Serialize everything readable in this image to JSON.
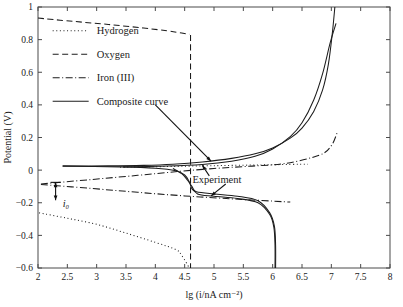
{
  "chart_data": {
    "type": "line",
    "title": "",
    "xlabel": "lg (i/nA cm⁻²)",
    "ylabel": "Potential (V)",
    "xlim": [
      2,
      8
    ],
    "ylim": [
      -0.6,
      1
    ],
    "grid": false,
    "legend_position": "upper-left-inside",
    "xticks": [
      "2",
      "2.5",
      "3",
      "3.5",
      "4",
      "4.5",
      "5",
      "5.5",
      "6",
      "6.5",
      "7",
      "7.5",
      "8"
    ],
    "xtick_values": [
      2,
      2.5,
      3,
      3.5,
      4,
      4.5,
      5,
      5.5,
      6,
      6.5,
      7,
      7.5,
      8
    ],
    "yticks": [
      "1",
      "0.8",
      "0.6",
      "0.4",
      "0.2",
      "0",
      "−0.2",
      "−0.4",
      "−0.6"
    ],
    "ytick_values": [
      1,
      0.8,
      0.6,
      0.4,
      0.2,
      0,
      -0.2,
      -0.4,
      -0.6
    ],
    "series": [
      {
        "name": "Hydrogen",
        "style": "dotted",
        "color": "#1c1c1c",
        "branches": [
          {
            "name": "hydrogen-cathodic",
            "points": [
              [
                2.02,
                -0.262
              ],
              [
                2.5,
                -0.295
              ],
              [
                3.0,
                -0.332
              ],
              [
                3.5,
                -0.386
              ],
              [
                4.0,
                -0.443
              ],
              [
                4.35,
                -0.487
              ],
              [
                4.45,
                -0.523
              ],
              [
                4.58,
                -0.6
              ]
            ]
          },
          {
            "name": "hydrogen-anodic",
            "points": [
              [
                3.4,
                0.018
              ],
              [
                4.2,
                0.022
              ],
              [
                4.8,
                0.026
              ],
              [
                5.3,
                0.029
              ],
              [
                5.8,
                0.032
              ],
              [
                6.3,
                0.035
              ],
              [
                6.6,
                0.036
              ]
            ]
          }
        ]
      },
      {
        "name": "Oxygen",
        "style": "dashed",
        "color": "#1c1c1c",
        "branches": [
          {
            "name": "oxygen-limiting",
            "points": [
              [
                2.0,
                0.932
              ],
              [
                2.6,
                0.912
              ],
              [
                3.2,
                0.893
              ],
              [
                3.8,
                0.871
              ],
              [
                4.2,
                0.854
              ],
              [
                4.45,
                0.84
              ],
              [
                4.58,
                0.833
              ]
            ]
          },
          {
            "name": "oxygen-vertical",
            "points": [
              [
                4.6,
                0.828
              ],
              [
                4.6,
                0.4
              ],
              [
                4.6,
                0.0
              ],
              [
                4.6,
                -0.3
              ],
              [
                4.6,
                -0.6
              ]
            ]
          }
        ]
      },
      {
        "name": "Iron (III)",
        "style": "dash-dot",
        "color": "#1c1c1c",
        "branches": [
          {
            "name": "iron-upper",
            "points": [
              [
                2.05,
                -0.085
              ],
              [
                2.9,
                -0.058
              ],
              [
                3.7,
                -0.032
              ],
              [
                4.4,
                -0.008
              ],
              [
                5.0,
                0.01
              ],
              [
                5.6,
                0.024
              ],
              [
                6.2,
                0.04
              ],
              [
                6.8,
                0.092
              ],
              [
                7.0,
                0.15
              ],
              [
                7.1,
                0.23
              ]
            ]
          },
          {
            "name": "iron-lower",
            "points": [
              [
                2.05,
                -0.088
              ],
              [
                2.9,
                -0.112
              ],
              [
                3.7,
                -0.136
              ],
              [
                4.5,
                -0.158
              ],
              [
                5.3,
                -0.176
              ],
              [
                6.0,
                -0.19
              ],
              [
                6.3,
                -0.196
              ]
            ]
          }
        ]
      },
      {
        "name": "Composite curve",
        "style": "solid",
        "color": "#1c1c1c",
        "branches": [
          {
            "name": "composite-anodic",
            "points": [
              [
                2.42,
                0.026
              ],
              [
                3.2,
                0.026
              ],
              [
                3.8,
                0.029
              ],
              [
                4.3,
                0.036
              ],
              [
                4.8,
                0.05
              ],
              [
                5.3,
                0.072
              ],
              [
                5.7,
                0.1
              ],
              [
                6.0,
                0.136
              ],
              [
                6.3,
                0.196
              ],
              [
                6.5,
                0.258
              ],
              [
                6.7,
                0.36
              ],
              [
                6.85,
                0.49
              ],
              [
                6.95,
                0.65
              ],
              [
                7.02,
                0.85
              ],
              [
                7.06,
                1.0
              ]
            ]
          },
          {
            "name": "composite-cathodic",
            "points": [
              [
                2.42,
                0.024
              ],
              [
                3.4,
                0.02
              ],
              [
                4.0,
                0.012
              ],
              [
                4.35,
                -0.004
              ],
              [
                4.5,
                -0.03
              ],
              [
                4.58,
                -0.072
              ],
              [
                4.62,
                -0.112
              ],
              [
                4.7,
                -0.132
              ],
              [
                5.0,
                -0.146
              ],
              [
                5.4,
                -0.16
              ],
              [
                5.75,
                -0.188
              ],
              [
                5.95,
                -0.262
              ],
              [
                6.03,
                -0.345
              ],
              [
                6.05,
                -0.46
              ],
              [
                6.05,
                -0.6
              ]
            ]
          }
        ]
      },
      {
        "name": "Experiment",
        "style": "solid",
        "color": "#1c1c1c",
        "branches": [
          {
            "name": "experiment-anodic",
            "points": [
              [
                3.45,
                0.02
              ],
              [
                4.2,
                0.025
              ],
              [
                4.8,
                0.035
              ],
              [
                5.3,
                0.055
              ],
              [
                5.7,
                0.085
              ],
              [
                6.0,
                0.13
              ],
              [
                6.3,
                0.205
              ],
              [
                6.5,
                0.29
              ],
              [
                6.7,
                0.43
              ],
              [
                6.85,
                0.59
              ],
              [
                6.98,
                0.78
              ],
              [
                7.08,
                0.9
              ]
            ]
          },
          {
            "name": "experiment-cathodic",
            "points": [
              [
                4.3,
                0.01
              ],
              [
                4.45,
                -0.022
              ],
              [
                4.55,
                -0.062
              ],
              [
                4.62,
                -0.098
              ],
              [
                4.72,
                -0.146
              ],
              [
                5.0,
                -0.16
              ],
              [
                5.4,
                -0.174
              ],
              [
                5.75,
                -0.2
              ],
              [
                5.95,
                -0.272
              ],
              [
                6.02,
                -0.35
              ],
              [
                6.04,
                -0.46
              ],
              [
                6.04,
                -0.6
              ]
            ]
          }
        ]
      }
    ],
    "annotations": [
      {
        "name": "i0-annotation",
        "label": "i₀",
        "x": 2.3,
        "y_from": -0.075,
        "y_to": -0.185,
        "label_x": 2.42,
        "label_y": -0.205
      },
      {
        "name": "experiment-annotation",
        "label": "Experiment",
        "label_x": 5.05,
        "label_y": -0.055
      },
      {
        "name": "composite-curve-leader",
        "label": "",
        "from_x": 4.0,
        "from_y": 0.4,
        "to_x": 4.95,
        "to_y": 0.055
      }
    ]
  },
  "legend": {
    "entries": [
      {
        "label": "Hydrogen",
        "style": "dotted"
      },
      {
        "label": "Oxygen",
        "style": "dashed"
      },
      {
        "label": "Iron (III)",
        "style": "dash-dot"
      },
      {
        "label": "Composite curve",
        "style": "solid"
      }
    ]
  }
}
